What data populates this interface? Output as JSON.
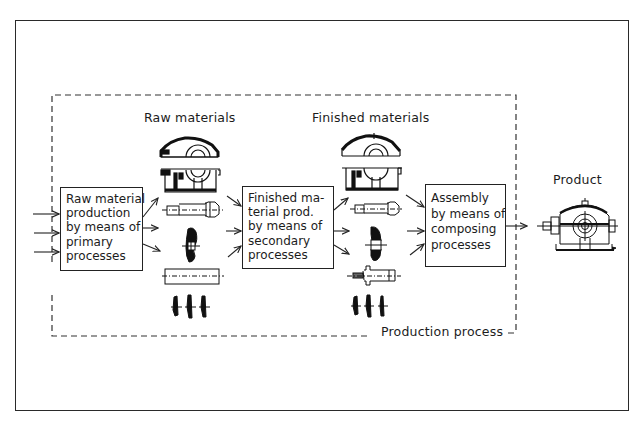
{
  "diagram": {
    "title": "Production process",
    "labels": {
      "raw_materials": "Raw materials",
      "finished_materials": "Finished materials",
      "product": "Product",
      "production_process": "Production process"
    },
    "boxes": [
      {
        "id": "primary",
        "lines": [
          "Raw material",
          "production",
          "by means of",
          "primary",
          "processes"
        ]
      },
      {
        "id": "secondary",
        "lines": [
          "Finished ma-",
          "terial prod.",
          "by means of",
          "secondary",
          "processes"
        ]
      },
      {
        "id": "composing",
        "lines": [
          "Assembly",
          "by means of",
          "composing",
          "processes"
        ]
      }
    ],
    "parts": {
      "raw": [
        "housing-cover",
        "housing-base",
        "shaft-blank",
        "gear-blank",
        "bar-stock",
        "small-gear-blanks"
      ],
      "finished": [
        "housing-cover",
        "housing-base",
        "machined-shaft",
        "machined-gear",
        "pinion-shaft",
        "small-gears"
      ]
    },
    "product_icon": "gearbox-assembly-icon",
    "colors": {
      "ink": "#1c1c1c",
      "background": "#ffffff"
    }
  }
}
